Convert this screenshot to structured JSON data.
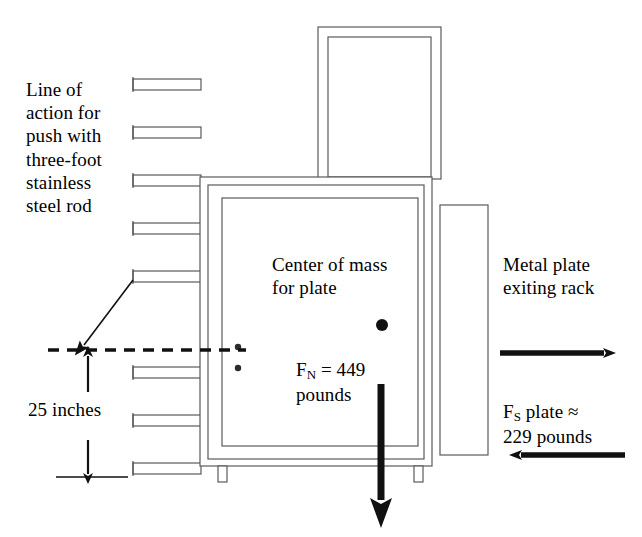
{
  "diagram": {
    "background_color": "#ffffff",
    "line_color": "#000000",
    "thin_line_color": "#3a3a3a",
    "annotations": {
      "line_of_action": "Line of\naction for\npush with\nthree-foot\nstainless\nsteel rod",
      "dimension_25_inches": "25 inches",
      "center_of_mass": "Center of mass\nfor plate",
      "force_normal_symbol": "F",
      "force_normal_subscript": "N",
      "force_normal_value": " = 449\npounds",
      "metal_plate_exiting": "Metal plate\nexiting rack",
      "force_shear_symbol": "F",
      "force_shear_subscript": "S",
      "force_shear_value": " plate ≈\n229 pounds"
    },
    "forces": [
      {
        "name": "F_N",
        "label": "F_N = 449 pounds",
        "magnitude": 449,
        "units": "pounds",
        "direction": "down"
      },
      {
        "name": "F_S",
        "label": "F_S plate ≈ 229 pounds",
        "magnitude": 229,
        "units": "pounds",
        "direction": "left",
        "approximate": true
      },
      {
        "name": "push",
        "label": "Metal plate exiting rack",
        "direction": "right"
      }
    ],
    "dimensions": [
      {
        "name": "height-of-line-of-action",
        "value": 25,
        "units": "inches",
        "label": "25 inches"
      }
    ],
    "rack": {
      "shelf_count": 8,
      "shelf_x": 133,
      "shelf_width": 68,
      "shelf_height": 11,
      "shelf_tops": [
        79,
        127,
        175,
        223,
        271,
        319,
        367,
        415
      ]
    },
    "cabinet": {
      "outer": {
        "x": 200,
        "y": 177,
        "width": 232,
        "height": 289
      },
      "middle": {
        "x": 208,
        "y": 185,
        "width": 216,
        "height": 274
      },
      "inner": {
        "x": 222,
        "y": 198,
        "width": 196,
        "height": 248
      },
      "legs": [
        {
          "x": 218,
          "y": 466,
          "width": 9,
          "height": 16
        },
        {
          "x": 414,
          "y": 466,
          "width": 9,
          "height": 16
        }
      ],
      "hinges": [
        {
          "cx": 238,
          "cy": 347,
          "r": 3
        },
        {
          "cx": 238,
          "cy": 368,
          "r": 3
        }
      ]
    },
    "top_plate": {
      "outer": {
        "x": 318,
        "y": 27,
        "width": 123,
        "height": 152
      },
      "inner": {
        "x": 328,
        "y": 37,
        "width": 103,
        "height": 140
      }
    },
    "exit_plate": {
      "x": 440,
      "y": 205,
      "width": 48,
      "height": 250
    },
    "center_of_mass_dot": {
      "cx": 382,
      "cy": 325,
      "r": 6
    },
    "dashed_line": {
      "x1": 48,
      "x2": 246,
      "y": 350
    },
    "leader_arrow": {
      "x1": 133,
      "y1": 282,
      "x2": 81,
      "y2": 350
    }
  }
}
